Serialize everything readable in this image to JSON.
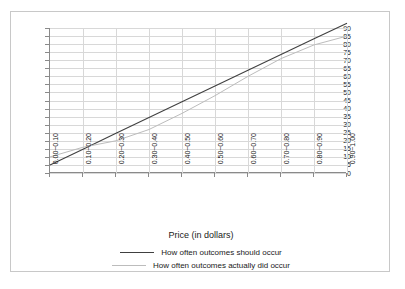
{
  "chart_data": {
    "type": "line",
    "title": "",
    "xlabel": "Price (in dollars)",
    "ylabel": "",
    "categories": [
      "0.00~0.10",
      "0.10~0.20",
      "0.20~0.30",
      "0.30~0.40",
      "0.40~0.50",
      "0.50~0.60",
      "0.60~0.70",
      "0.70~0.80",
      "0.80~0.90",
      "0.90~1.00"
    ],
    "ylim": [
      0,
      90
    ],
    "yticks": [
      0,
      5,
      10,
      15,
      20,
      25,
      30,
      35,
      40,
      45,
      50,
      55,
      60,
      65,
      70,
      75,
      80,
      85,
      90
    ],
    "grid": true,
    "legend_position": "bottom",
    "series": [
      {
        "name": "How often outcomes should occur",
        "color": "#404040",
        "style": "solid",
        "values": [
          5,
          14.8,
          24.6,
          34.4,
          44.2,
          54,
          63.8,
          73.6,
          83.4,
          93
        ]
      },
      {
        "name": "How often outcomes actually did occur",
        "color": "#bcbcbc",
        "style": "solid",
        "values": [
          10,
          16,
          20,
          27,
          37,
          48,
          60,
          71,
          79.5,
          85
        ]
      }
    ]
  },
  "legend": {
    "entries": [
      {
        "label": "How often outcomes should occur",
        "color": "#404040"
      },
      {
        "label": "How often outcomes actually did occur",
        "color": "#bcbcbc"
      }
    ]
  },
  "axis": {
    "x_title": "Price (in dollars)"
  }
}
